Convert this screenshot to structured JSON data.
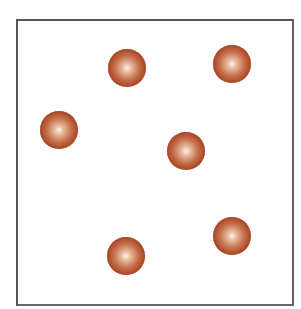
{
  "diagram": {
    "box": {
      "left": 16,
      "top": 19,
      "right": 292,
      "bottom": 303,
      "border_color": "#555555"
    },
    "sphere_color": "#a8401f",
    "sphere_radius": 19,
    "particles": [
      {
        "id": 1,
        "cx": 127,
        "cy": 68
      },
      {
        "id": 2,
        "cx": 232,
        "cy": 64
      },
      {
        "id": 3,
        "cx": 59,
        "cy": 130
      },
      {
        "id": 4,
        "cx": 186,
        "cy": 151
      },
      {
        "id": 5,
        "cx": 232,
        "cy": 236
      },
      {
        "id": 6,
        "cx": 126,
        "cy": 256
      }
    ]
  }
}
